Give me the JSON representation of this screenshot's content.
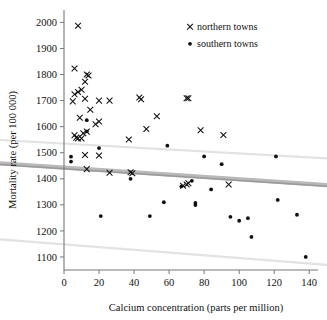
{
  "chart_data": {
    "type": "scatter",
    "title": "",
    "xlabel": "Calcium concentration (parts per million)",
    "ylabel": "Mortality rate (per 100 000)",
    "xlim": [
      0,
      145
    ],
    "ylim": [
      1050,
      2040
    ],
    "xticks": [
      0,
      20,
      40,
      60,
      80,
      100,
      120,
      140
    ],
    "yticks": [
      1100,
      1200,
      1300,
      1400,
      1500,
      1600,
      1700,
      1800,
      1900,
      2000
    ],
    "grid": false,
    "legend_position": "top-right",
    "legend": [
      {
        "label": "northern towns",
        "marker": "cross"
      },
      {
        "label": "southern towns",
        "marker": "dot"
      }
    ],
    "series": [
      {
        "name": "northern towns",
        "marker": "cross",
        "points": [
          [
            8,
            1987
          ],
          [
            6,
            1823
          ],
          [
            13,
            1800
          ],
          [
            14,
            1796
          ],
          [
            12,
            1772
          ],
          [
            10,
            1742
          ],
          [
            8,
            1733
          ],
          [
            6,
            1724
          ],
          [
            5,
            1697
          ],
          [
            12,
            1707
          ],
          [
            20,
            1700
          ],
          [
            26,
            1700
          ],
          [
            43,
            1712
          ],
          [
            44,
            1705
          ],
          [
            70,
            1709
          ],
          [
            71,
            1709
          ],
          [
            15,
            1665
          ],
          [
            9,
            1634
          ],
          [
            20,
            1620
          ],
          [
            18,
            1609
          ],
          [
            53,
            1640
          ],
          [
            13,
            1581
          ],
          [
            11,
            1575
          ],
          [
            6,
            1567
          ],
          [
            7,
            1558
          ],
          [
            8,
            1555
          ],
          [
            10,
            1555
          ],
          [
            47,
            1591
          ],
          [
            78,
            1586
          ],
          [
            91,
            1568
          ],
          [
            37,
            1551
          ],
          [
            12,
            1491
          ],
          [
            20,
            1489
          ],
          [
            13,
            1437
          ],
          [
            26,
            1423
          ],
          [
            38,
            1425
          ],
          [
            39,
            1421
          ],
          [
            68,
            1373
          ],
          [
            70,
            1378
          ],
          [
            71,
            1383
          ],
          [
            94,
            1378
          ]
        ]
      },
      {
        "name": "southern towns",
        "marker": "dot",
        "points": [
          [
            13,
            1625
          ],
          [
            13,
            1582
          ],
          [
            20,
            1518
          ],
          [
            59,
            1527
          ],
          [
            80,
            1486
          ],
          [
            121,
            1486
          ],
          [
            4,
            1485
          ],
          [
            4,
            1466
          ],
          [
            90,
            1456
          ],
          [
            73,
            1392
          ],
          [
            38,
            1400
          ],
          [
            67,
            1371
          ],
          [
            84,
            1359
          ],
          [
            75,
            1307
          ],
          [
            75,
            1299
          ],
          [
            57,
            1310
          ],
          [
            122,
            1319
          ],
          [
            21,
            1257
          ],
          [
            49,
            1257
          ],
          [
            95,
            1254
          ],
          [
            105,
            1249
          ],
          [
            133,
            1262
          ],
          [
            100,
            1239
          ],
          [
            107,
            1177
          ],
          [
            138,
            1100
          ]
        ]
      }
    ],
    "fit_line": {
      "name": "regression line",
      "x": [
        0,
        145
      ],
      "y": [
        1443,
        1378
      ]
    },
    "bands": [
      {
        "name": "upper band",
        "x": [
          0,
          145
        ],
        "y": [
          1535,
          1480
        ]
      },
      {
        "name": "lower band",
        "x": [
          0,
          145
        ],
        "y": [
          1148,
          1072
        ]
      }
    ]
  }
}
